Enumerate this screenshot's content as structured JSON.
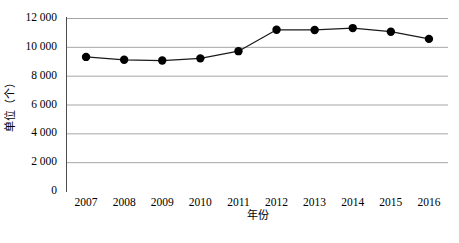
{
  "chart_data": {
    "type": "line",
    "title": "",
    "subtitle": "",
    "xlabel": "年份",
    "ylabel": "单位（个）",
    "categories": [
      "2007",
      "2008",
      "2009",
      "2010",
      "2011",
      "2012",
      "2013",
      "2014",
      "2015",
      "2016"
    ],
    "values": [
      9300,
      9100,
      9050,
      9200,
      9700,
      11180,
      11170,
      11300,
      11050,
      10550
    ],
    "series": [
      {
        "name": "",
        "values": [
          9300,
          9100,
          9050,
          9200,
          9700,
          11180,
          11170,
          11300,
          11050,
          10550
        ]
      }
    ],
    "ylim": [
      0,
      12000
    ],
    "ytick_values": [
      0,
      2000,
      4000,
      6000,
      8000,
      10000,
      12000
    ],
    "ytick_labels": [
      "0",
      "2 000",
      "4 000",
      "6 000",
      "8 000",
      "10 000",
      "12 000"
    ],
    "xtick_labels": [
      "2007",
      "2008",
      "2009",
      "2010",
      "2011",
      "2012",
      "2013",
      "2014",
      "2015",
      "2016"
    ],
    "grid": "horizontal",
    "legend": "none",
    "annotations": [],
    "marker": "filled-circle",
    "colors": {
      "line": "#1a1a1a",
      "marker": "#000000",
      "gridline": "#a6a6a6",
      "axis": "#4d4d4d",
      "background": "#ffffff",
      "text": "#000000"
    }
  },
  "caption": {
    "text": ""
  }
}
